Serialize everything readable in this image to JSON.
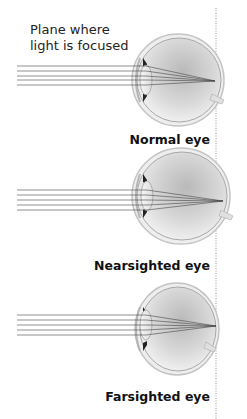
{
  "caption": {
    "line1": "Plane where",
    "line2": "light is focused"
  },
  "panels": [
    {
      "label": "Normal eye",
      "focus": "on retina"
    },
    {
      "label": "Nearsighted eye",
      "focus": "in front of retina"
    },
    {
      "label": "Farsighted eye",
      "focus": "behind retina"
    }
  ],
  "colors": {
    "rays": "#444444",
    "focal_plane": "#999999",
    "eye_outline": "#9a9a9a",
    "eye_fill": "#e4e4e4",
    "iris": "#222222"
  }
}
